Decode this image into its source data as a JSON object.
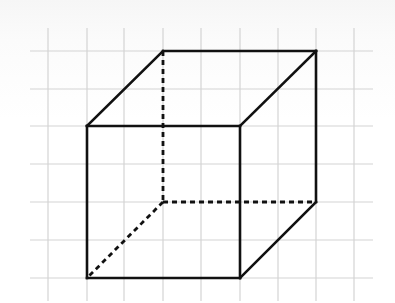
{
  "figure": {
    "colors": {
      "grid": "#d4d4d4",
      "edge": "#111111",
      "background": "#ffffff"
    },
    "grid": {
      "vertical_x": [
        48,
        87,
        124,
        163,
        201,
        240,
        278,
        316,
        354
      ],
      "vertical_y_range": [
        28,
        301
      ],
      "horizontal_y": [
        51,
        89,
        126,
        164,
        202,
        240,
        278
      ],
      "horizontal_x_range": [
        30,
        373
      ],
      "cell_size": 38
    },
    "cube": {
      "vertices": {
        "front_top_left": [
          87,
          126
        ],
        "front_top_right": [
          240,
          126
        ],
        "front_bottom_left": [
          87,
          278
        ],
        "front_bottom_right": [
          240,
          278
        ],
        "back_top_left": [
          163,
          51
        ],
        "back_top_right": [
          316,
          51
        ],
        "back_bottom_left": [
          163,
          202
        ],
        "back_bottom_right": [
          316,
          202
        ]
      },
      "visible_edges": [
        [
          "front_top_left",
          "front_top_right"
        ],
        [
          "front_top_right",
          "front_bottom_right"
        ],
        [
          "front_bottom_right",
          "front_bottom_left"
        ],
        [
          "front_bottom_left",
          "front_top_left"
        ],
        [
          "front_top_left",
          "back_top_left"
        ],
        [
          "back_top_left",
          "back_top_right"
        ],
        [
          "back_top_right",
          "front_top_right"
        ],
        [
          "back_top_right",
          "back_bottom_right"
        ],
        [
          "back_bottom_right",
          "front_bottom_right"
        ]
      ],
      "hidden_edges": [
        [
          "back_top_left",
          "back_bottom_left"
        ],
        [
          "back_bottom_left",
          "back_bottom_right"
        ],
        [
          "back_bottom_left",
          "front_bottom_left"
        ]
      ]
    }
  }
}
